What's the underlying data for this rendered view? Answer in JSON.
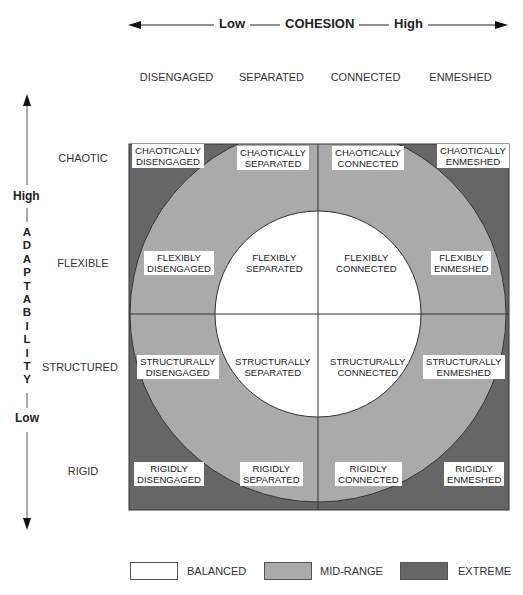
{
  "cohesion_axis": {
    "low_label": "Low",
    "title": "COHESION",
    "high_label": "High"
  },
  "columns": [
    "DISENGAGED",
    "SEPARATED",
    "CONNECTED",
    "ENMESHED"
  ],
  "adaptability_axis": {
    "high_label": "High",
    "low_label": "Low",
    "letters": [
      "A",
      "D",
      "A",
      "P",
      "T",
      "A",
      "B",
      "I",
      "L",
      "I",
      "T",
      "Y"
    ]
  },
  "rows": [
    "CHAOTIC",
    "FLEXIBLE",
    "STRUCTURED",
    "RIGID"
  ],
  "cells": [
    [
      {
        "line1": "CHAOTICALLY",
        "line2": "DISENGAGED",
        "level": "extreme"
      },
      {
        "line1": "CHAOTICALLY",
        "line2": "SEPARATED",
        "level": "mid-range"
      },
      {
        "line1": "CHAOTICALLY",
        "line2": "CONNECTED",
        "level": "mid-range"
      },
      {
        "line1": "CHAOTICALLY",
        "line2": "ENMESHED",
        "level": "extreme"
      }
    ],
    [
      {
        "line1": "FLEXIBLY",
        "line2": "DISENGAGED",
        "level": "mid-range"
      },
      {
        "line1": "FLEXIBLY",
        "line2": "SEPARATED",
        "level": "balanced"
      },
      {
        "line1": "FLEXIBLY",
        "line2": "CONNECTED",
        "level": "balanced"
      },
      {
        "line1": "FLEXIBLY",
        "line2": "ENMESHED",
        "level": "mid-range"
      }
    ],
    [
      {
        "line1": "STRUCTURALLY",
        "line2": "DISENGAGED",
        "level": "mid-range"
      },
      {
        "line1": "STRUCTURALLY",
        "line2": "SEPARATED",
        "level": "balanced"
      },
      {
        "line1": "STRUCTURALLY",
        "line2": "CONNECTED",
        "level": "balanced"
      },
      {
        "line1": "STRUCTURALLY",
        "line2": "ENMESHED",
        "level": "mid-range"
      }
    ],
    [
      {
        "line1": "RIGIDLY",
        "line2": "DISENGAGED",
        "level": "extreme"
      },
      {
        "line1": "RIGIDLY",
        "line2": "SEPARATED",
        "level": "mid-range"
      },
      {
        "line1": "RIGIDLY",
        "line2": "CONNECTED",
        "level": "mid-range"
      },
      {
        "line1": "RIGIDLY",
        "line2": "ENMESHED",
        "level": "extreme"
      }
    ]
  ],
  "legend": [
    {
      "label": "BALANCED",
      "color": "#ffffff"
    },
    {
      "label": "MID-RANGE",
      "color": "#aaaaaa"
    },
    {
      "label": "EXTREME",
      "color": "#666666"
    }
  ],
  "colors": {
    "balanced": "#ffffff",
    "mid_range": "#aaaaaa",
    "extreme": "#666666",
    "lines": "#333333"
  }
}
